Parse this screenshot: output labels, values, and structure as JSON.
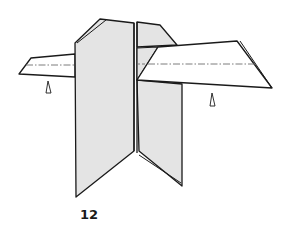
{
  "diagram": {
    "step_number": "12",
    "colors": {
      "paper_shaded": "#e4e4e4",
      "paper_white": "#ffffff",
      "outline": "#1a1a1a",
      "fold_line": "#6e6e6e"
    },
    "symbols": {
      "left_arrow": "push-arrow-icon",
      "right_arrow": "push-arrow-icon"
    }
  }
}
